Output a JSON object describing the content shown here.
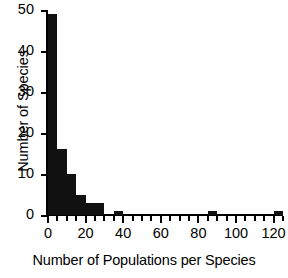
{
  "chart_data": {
    "type": "bar",
    "title": "",
    "subtitle": "",
    "xlabel": "Number of Populations per Species",
    "ylabel": "Number of Species",
    "xlim": [
      0,
      125
    ],
    "ylim": [
      0,
      50
    ],
    "grid": false,
    "legend": null,
    "bin_width": 5,
    "xticks": [
      {
        "value": 0,
        "label": "0",
        "type": "major"
      },
      {
        "value": 5,
        "label": "",
        "type": "minor"
      },
      {
        "value": 10,
        "label": "",
        "type": "minor"
      },
      {
        "value": 15,
        "label": "",
        "type": "minor"
      },
      {
        "value": 20,
        "label": "20",
        "type": "major"
      },
      {
        "value": 25,
        "label": "",
        "type": "minor"
      },
      {
        "value": 30,
        "label": "",
        "type": "minor"
      },
      {
        "value": 35,
        "label": "",
        "type": "minor"
      },
      {
        "value": 40,
        "label": "40",
        "type": "major"
      },
      {
        "value": 45,
        "label": "",
        "type": "minor"
      },
      {
        "value": 50,
        "label": "",
        "type": "minor"
      },
      {
        "value": 55,
        "label": "",
        "type": "minor"
      },
      {
        "value": 60,
        "label": "60",
        "type": "major"
      },
      {
        "value": 65,
        "label": "",
        "type": "minor"
      },
      {
        "value": 70,
        "label": "",
        "type": "minor"
      },
      {
        "value": 75,
        "label": "",
        "type": "minor"
      },
      {
        "value": 80,
        "label": "80",
        "type": "major"
      },
      {
        "value": 85,
        "label": "",
        "type": "minor"
      },
      {
        "value": 90,
        "label": "",
        "type": "minor"
      },
      {
        "value": 95,
        "label": "",
        "type": "minor"
      },
      {
        "value": 100,
        "label": "100",
        "type": "major"
      },
      {
        "value": 105,
        "label": "",
        "type": "minor"
      },
      {
        "value": 110,
        "label": "",
        "type": "minor"
      },
      {
        "value": 115,
        "label": "",
        "type": "minor"
      },
      {
        "value": 120,
        "label": "120",
        "type": "major"
      },
      {
        "value": 125,
        "label": "",
        "type": "minor"
      }
    ],
    "yticks": [
      {
        "value": 0,
        "label": "0"
      },
      {
        "value": 10,
        "label": "10"
      },
      {
        "value": 20,
        "label": "20"
      },
      {
        "value": 30,
        "label": "30"
      },
      {
        "value": 40,
        "label": "40"
      },
      {
        "value": 50,
        "label": "50"
      }
    ],
    "bins": [
      {
        "x0": 0,
        "x1": 5,
        "value": 49
      },
      {
        "x0": 5,
        "x1": 10,
        "value": 16
      },
      {
        "x0": 10,
        "x1": 15,
        "value": 10
      },
      {
        "x0": 15,
        "x1": 20,
        "value": 5
      },
      {
        "x0": 20,
        "x1": 25,
        "value": 3
      },
      {
        "x0": 25,
        "x1": 30,
        "value": 3
      },
      {
        "x0": 35,
        "x1": 40,
        "value": 1
      },
      {
        "x0": 85,
        "x1": 90,
        "value": 1
      },
      {
        "x0": 120,
        "x1": 125,
        "value": 1
      }
    ],
    "categories": [
      "0-5",
      "5-10",
      "10-15",
      "15-20",
      "20-25",
      "25-30",
      "35-40",
      "85-90",
      "120-125"
    ],
    "values": [
      49,
      16,
      10,
      5,
      3,
      3,
      1,
      1,
      1
    ],
    "bar_color": "#111111",
    "axis_color": "#000000",
    "background": "#ffffff"
  }
}
